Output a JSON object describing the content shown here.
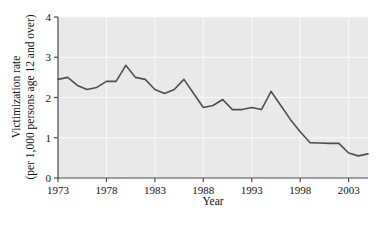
{
  "figure": {
    "background_color": "#ffffff",
    "plot_background_color": "#e9e9e9",
    "gridline_color": "#fafafa",
    "axis_color": "#4a4a4a",
    "series_color": "#4f4f4f"
  },
  "chart_data": {
    "type": "line",
    "title": "",
    "xlabel": "Year",
    "ylabel": "Victimization rate\n(per 1,000 persons age 12 and over)",
    "ylabel_line1": "Victimization rate",
    "ylabel_line2": "(per 1,000 persons age 12 and over)",
    "xlim": [
      1973,
      2005
    ],
    "ylim": [
      0,
      4
    ],
    "grid": true,
    "legend": "none",
    "xticks": [
      1973,
      1978,
      1983,
      1988,
      1993,
      1998,
      2003
    ],
    "xtick_labels": [
      "1973",
      "1978",
      "1983",
      "1988",
      "1993",
      "1998",
      "2003"
    ],
    "yticks": [
      0,
      1,
      2,
      3,
      4
    ],
    "ytick_labels": [
      "0",
      "1",
      "2",
      "3",
      "4"
    ],
    "x": [
      1973,
      1974,
      1975,
      1976,
      1977,
      1978,
      1979,
      1980,
      1981,
      1982,
      1983,
      1984,
      1985,
      1986,
      1987,
      1988,
      1989,
      1990,
      1991,
      1992,
      1993,
      1994,
      1995,
      1996,
      1997,
      1998,
      1999,
      2000,
      2001,
      2002,
      2003,
      2004,
      2005
    ],
    "values": [
      2.45,
      2.5,
      2.3,
      2.2,
      2.25,
      2.4,
      2.4,
      2.8,
      2.5,
      2.45,
      2.2,
      2.1,
      2.2,
      2.45,
      2.1,
      1.75,
      1.8,
      1.95,
      1.7,
      1.7,
      1.75,
      1.7,
      2.15,
      1.8,
      1.45,
      1.15,
      0.88,
      0.87,
      0.86,
      0.86,
      0.62,
      0.55,
      0.6
    ],
    "series": [
      {
        "name": "Victimization rate",
        "values": [
          2.45,
          2.5,
          2.3,
          2.2,
          2.25,
          2.4,
          2.4,
          2.8,
          2.5,
          2.45,
          2.2,
          2.1,
          2.2,
          2.45,
          2.1,
          1.75,
          1.8,
          1.95,
          1.7,
          1.7,
          1.75,
          1.7,
          2.15,
          1.8,
          1.45,
          1.15,
          0.88,
          0.87,
          0.86,
          0.86,
          0.62,
          0.55,
          0.6
        ]
      }
    ]
  }
}
